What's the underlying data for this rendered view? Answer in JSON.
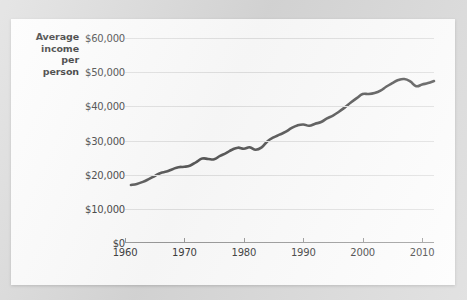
{
  "chart_data": {
    "type": "line",
    "title": "",
    "xlabel": "",
    "ylabel": "Average income per person",
    "ylabel_lines": [
      "Average",
      "income",
      "per",
      "person"
    ],
    "xlim": [
      1960,
      2012
    ],
    "ylim": [
      0,
      60000
    ],
    "ytick_labels": [
      "$0",
      "$10,000",
      "$20,000",
      "$30,000",
      "$40,000",
      "$50,000",
      "$60,000"
    ],
    "ytick_values": [
      0,
      10000,
      20000,
      30000,
      40000,
      50000,
      60000
    ],
    "xtick_labels": [
      "1960",
      "1970",
      "1980",
      "1990",
      "2000",
      "2010"
    ],
    "xtick_values": [
      1960,
      1970,
      1980,
      1990,
      2000,
      2010
    ],
    "grid": true,
    "legend": "none",
    "series": [
      {
        "name": "Average income per person",
        "color": "#595959",
        "x": [
          1961,
          1962,
          1963,
          1964,
          1965,
          1966,
          1967,
          1968,
          1969,
          1970,
          1971,
          1972,
          1973,
          1974,
          1975,
          1976,
          1977,
          1978,
          1979,
          1980,
          1981,
          1982,
          1983,
          1984,
          1985,
          1986,
          1987,
          1988,
          1989,
          1990,
          1991,
          1992,
          1993,
          1994,
          1995,
          1996,
          1997,
          1998,
          1999,
          2000,
          2001,
          2002,
          2003,
          2004,
          2005,
          2006,
          2007,
          2008,
          2009,
          2010,
          2011,
          2012
        ],
        "values": [
          17000,
          17300,
          17900,
          18700,
          19600,
          20500,
          20900,
          21600,
          22200,
          22300,
          22700,
          23700,
          24700,
          24600,
          24500,
          25500,
          26300,
          27300,
          27900,
          27600,
          28000,
          27300,
          28000,
          29800,
          30900,
          31700,
          32500,
          33600,
          34400,
          34700,
          34300,
          34900,
          35400,
          36500,
          37300,
          38400,
          39700,
          41100,
          42400,
          43600,
          43600,
          43900,
          44600,
          45800,
          46800,
          47700,
          48000,
          47300,
          45900,
          46400,
          46800,
          47400
        ]
      }
    ]
  }
}
